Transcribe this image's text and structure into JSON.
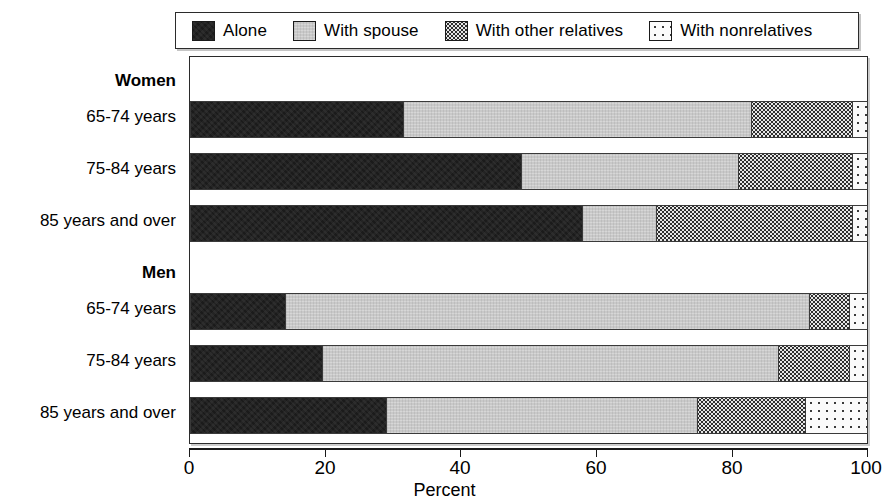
{
  "legend": {
    "items": [
      {
        "label": "Alone",
        "key": "alone",
        "color": "#1b1b1b",
        "pattern": "solid-black"
      },
      {
        "label": "With spouse",
        "key": "spouse",
        "color": "#c9c9c9",
        "pattern": "light-gray"
      },
      {
        "label": "With other relatives",
        "key": "other",
        "color": "#e6e6e6",
        "pattern": "dense-dots"
      },
      {
        "label": "With nonrelatives",
        "key": "nonrel",
        "color": "#fbfbfb",
        "pattern": "sparse-dots"
      }
    ]
  },
  "axis": {
    "x_title": "Percent",
    "x_ticks": [
      "0",
      "20",
      "40",
      "60",
      "80",
      "100"
    ],
    "x_min": 0,
    "x_max": 100
  },
  "categories": [
    {
      "label": "Women",
      "type": "group"
    },
    {
      "label": "65-74 years",
      "type": "bar"
    },
    {
      "label": "75-84 years",
      "type": "bar"
    },
    {
      "label": "85 years and over",
      "type": "bar"
    },
    {
      "label": "Men",
      "type": "group"
    },
    {
      "label": "65-74 years",
      "type": "bar"
    },
    {
      "label": "75-84 years",
      "type": "bar"
    },
    {
      "label": "85 years and over",
      "type": "bar"
    }
  ],
  "chart_data": {
    "type": "bar",
    "orientation": "horizontal",
    "stacked": true,
    "title": "",
    "xlabel": "Percent",
    "ylabel": "",
    "xlim": [
      0,
      100
    ],
    "grid": false,
    "legend_position": "top",
    "categories": [
      "Women 65-74 years",
      "Women 75-84 years",
      "Women 85 years and over",
      "Men 65-74 years",
      "Men 75-84 years",
      "Men 85 years and over"
    ],
    "series": [
      {
        "name": "Alone",
        "values": [
          31.5,
          49.0,
          58.0,
          14.0,
          19.5,
          29.0
        ]
      },
      {
        "name": "With spouse",
        "values": [
          51.5,
          32.0,
          11.0,
          77.5,
          67.5,
          46.0
        ]
      },
      {
        "name": "With other relatives",
        "values": [
          15.0,
          17.0,
          29.0,
          6.0,
          10.5,
          16.0
        ]
      },
      {
        "name": "With nonrelatives",
        "values": [
          2.0,
          2.0,
          2.0,
          2.5,
          2.5,
          9.0
        ]
      }
    ]
  }
}
